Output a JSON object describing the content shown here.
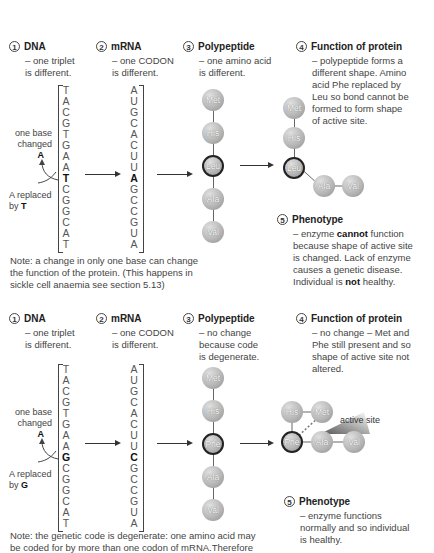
{
  "top": {
    "dna": {
      "num": "1",
      "title": "DNA",
      "desc": [
        "– one triplet",
        "is different."
      ]
    },
    "mrna": {
      "num": "2",
      "title": "mRNA",
      "desc": [
        "– one CODON",
        "is different."
      ]
    },
    "poly": {
      "num": "3",
      "title": "Polypeptide",
      "desc": [
        "– one amino acid",
        "is different."
      ]
    },
    "func": {
      "num": "4",
      "title": "Function of protein",
      "desc": [
        "– polypeptide forms a",
        "different shape. Amino",
        "acid Phe replaced by",
        "Leu so bond cannot be",
        "formed to form shape",
        "of active site."
      ]
    },
    "pheno": {
      "num": "5",
      "title": "Phenotype",
      "desc": [
        "– enzyme ",
        "cannot",
        " function",
        "because shape of active site",
        "is changed. Lack of enzyme",
        "causes a genetic disease.",
        "Individual is ",
        "not",
        " healthy."
      ]
    },
    "dna_bases": [
      "T",
      "A",
      "C",
      "G",
      "T",
      "G",
      "A",
      "A",
      "T",
      "C",
      "G",
      "G",
      "C",
      "A",
      "T"
    ],
    "mrna_bases": [
      "A",
      "U",
      "G",
      "C",
      "A",
      "C",
      "U",
      "U",
      "A",
      "G",
      "C",
      "C",
      "G",
      "U",
      "A"
    ],
    "changed_index": 8,
    "label_one_base": "one base",
    "label_changed": "changed",
    "label_orig_base": "A",
    "label_replaced": "A replaced",
    "label_by": "by ",
    "label_new_base": "T",
    "amino_acids": [
      "Met",
      "His",
      "Leu",
      "Ala",
      "Val"
    ],
    "note": [
      "Note: a change in only one base can change",
      "the function of the protein. (This happens in",
      "sickle cell anaemia see section 5.13)"
    ]
  },
  "bottom": {
    "dna": {
      "num": "1",
      "title": "DNA",
      "desc": [
        "– one triplet",
        "is different."
      ]
    },
    "mrna": {
      "num": "2",
      "title": "mRNA",
      "desc": [
        "– one CODON",
        "is different."
      ]
    },
    "poly": {
      "num": "3",
      "title": "Polypeptide",
      "desc": [
        "– no change",
        "because code",
        "is degenerate."
      ]
    },
    "func": {
      "num": "4",
      "title": "Function of protein",
      "desc": [
        "– no change – Met and",
        "Phe still present and so",
        "shape of active site not",
        "altered."
      ]
    },
    "pheno": {
      "num": "5",
      "title": "Phenotype",
      "desc": [
        "– enzyme functions",
        "normally and so individual",
        "is healthy."
      ]
    },
    "dna_bases": [
      "T",
      "A",
      "C",
      "G",
      "T",
      "G",
      "A",
      "A",
      "G",
      "C",
      "G",
      "G",
      "C",
      "A",
      "T"
    ],
    "mrna_bases": [
      "A",
      "U",
      "G",
      "C",
      "A",
      "C",
      "U",
      "U",
      "C",
      "G",
      "C",
      "C",
      "G",
      "U",
      "A"
    ],
    "changed_index": 8,
    "label_one_base": "one base",
    "label_changed": "changed",
    "label_orig_base": "A",
    "label_replaced": "A replaced",
    "label_by": "by ",
    "label_new_base": "G",
    "amino_acids": [
      "Met",
      "His",
      "Phe",
      "Ala",
      "Val"
    ],
    "active_site_label": "active site",
    "note": [
      "Note: the genetic code is degenerate: one amino acid may",
      "be coded for by more than one codon of mRNA.Therefore"
    ]
  }
}
